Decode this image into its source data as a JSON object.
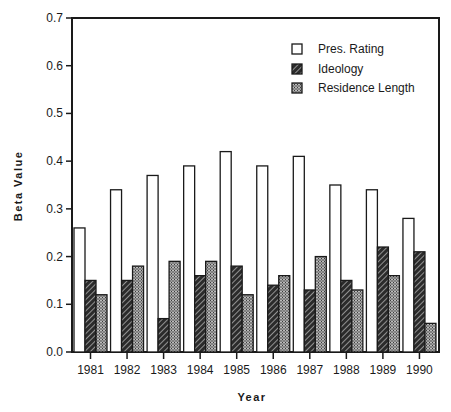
{
  "chart_data": {
    "type": "bar",
    "title": "",
    "xlabel": "Year",
    "ylabel": "Beta Value",
    "ylim": [
      0.0,
      0.7
    ],
    "yticks": [
      "0.0",
      "0.1",
      "0.2",
      "0.3",
      "0.4",
      "0.5",
      "0.6",
      "0.7"
    ],
    "grid": false,
    "legend_position": "top-right",
    "categories": [
      "1981",
      "1982",
      "1983",
      "1984",
      "1985",
      "1986",
      "1987",
      "1988",
      "1989",
      "1990"
    ],
    "series": [
      {
        "name": "Pres. Rating",
        "pattern": "white",
        "values": [
          0.26,
          0.34,
          0.37,
          0.39,
          0.42,
          0.39,
          0.41,
          0.35,
          0.34,
          0.28
        ]
      },
      {
        "name": "Ideology",
        "pattern": "dark-hatched",
        "values": [
          0.15,
          0.15,
          0.07,
          0.16,
          0.18,
          0.14,
          0.13,
          0.15,
          0.22,
          0.21
        ]
      },
      {
        "name": "Residence Length",
        "pattern": "gray-stipple",
        "values": [
          0.12,
          0.18,
          0.19,
          0.19,
          0.12,
          0.16,
          0.2,
          0.13,
          0.16,
          0.06
        ]
      }
    ]
  },
  "colors": {
    "axis": "#1a1a1a",
    "pres_fill": "#ffffff",
    "ideology_fill": "#2b2b2b",
    "residence_fill": "#8a8a8a"
  }
}
